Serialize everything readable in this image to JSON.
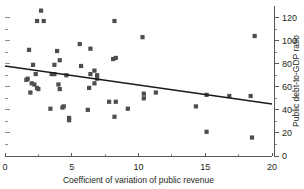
{
  "chart_data": {
    "type": "scatter",
    "title": "",
    "xlabel": "Coefficient of variation of public revenue",
    "ylabel": "Public debt-to-GDP ratio",
    "xlim": [
      0,
      20
    ],
    "ylim": [
      0,
      130
    ],
    "grid": false,
    "legend": null,
    "x_ticks": [
      0,
      5,
      10,
      15,
      20
    ],
    "x_tick_labels": [
      "0",
      "5",
      "10",
      "15",
      "20"
    ],
    "x_minor_ticks": [
      2.5,
      7.5,
      12.5,
      17.5
    ],
    "y_ticks": [
      0,
      20,
      40,
      60,
      80,
      100,
      120
    ],
    "y_tick_labels": [
      "0",
      "20",
      "40",
      "60",
      "80",
      "100",
      "120"
    ],
    "y_minor_ticks": [
      10,
      30,
      50,
      70,
      90,
      110
    ],
    "y_axis_side": "right",
    "marker_shape": "square",
    "marker_color": "#4d4d4f",
    "points": [
      [
        2.7,
        126
      ],
      [
        2.4,
        117
      ],
      [
        2.9,
        117
      ],
      [
        8.2,
        117
      ],
      [
        10.3,
        103
      ],
      [
        18.7,
        104
      ],
      [
        1.8,
        92
      ],
      [
        3.9,
        91
      ],
      [
        5.6,
        97
      ],
      [
        6.4,
        93
      ],
      [
        2.1,
        79
      ],
      [
        4.1,
        83
      ],
      [
        8.1,
        84
      ],
      [
        8.3,
        85
      ],
      [
        3.7,
        79
      ],
      [
        5.7,
        78
      ],
      [
        6.7,
        74
      ],
      [
        1.6,
        66
      ],
      [
        1.7,
        67
      ],
      [
        2.3,
        71
      ],
      [
        3.5,
        71
      ],
      [
        3.7,
        71
      ],
      [
        4.6,
        70
      ],
      [
        6.4,
        71
      ],
      [
        6.9,
        70
      ],
      [
        6.9,
        67
      ],
      [
        2.0,
        63
      ],
      [
        2.2,
        62
      ],
      [
        2.4,
        59
      ],
      [
        1.9,
        55
      ],
      [
        2.5,
        58
      ],
      [
        4.0,
        62
      ],
      [
        4.1,
        58
      ],
      [
        6.3,
        59
      ],
      [
        6.7,
        63
      ],
      [
        10.4,
        54
      ],
      [
        10.4,
        50
      ],
      [
        11.3,
        55
      ],
      [
        15.1,
        53
      ],
      [
        16.8,
        52
      ],
      [
        18.4,
        52
      ],
      [
        7.8,
        47
      ],
      [
        8.3,
        47
      ],
      [
        3.4,
        41
      ],
      [
        4.3,
        42
      ],
      [
        4.4,
        43
      ],
      [
        6.2,
        40
      ],
      [
        9.2,
        41
      ],
      [
        14.3,
        43
      ],
      [
        4.8,
        33
      ],
      [
        4.8,
        31
      ],
      [
        8.2,
        34
      ],
      [
        15.1,
        21
      ],
      [
        18.5,
        16
      ]
    ],
    "trendline": {
      "visible": true,
      "x_start": 0,
      "y_start": 78,
      "x_end": 20,
      "y_end": 45,
      "color": "#1a1a1a"
    }
  }
}
